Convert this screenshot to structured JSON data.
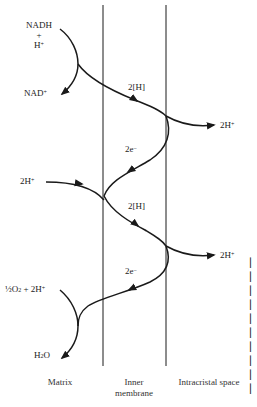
{
  "figure": {
    "reactants_top": {
      "line1": "NADH",
      "line2": "+",
      "line3": "H",
      "line3_sup": "+"
    },
    "product_top": {
      "text": "NAD",
      "sup": "+"
    },
    "transfer_1": "2[H]",
    "proton_out_1": {
      "text": "2H",
      "sup": "+"
    },
    "electron_1": {
      "text": "2e",
      "sup": "−"
    },
    "proton_in": {
      "text": "2H",
      "sup": "+"
    },
    "transfer_2": "2[H]",
    "proton_out_2": {
      "text": "2H",
      "sup": "+"
    },
    "electron_2": {
      "text": "2e",
      "sup": "−"
    },
    "reactants_bottom": {
      "frac": "½",
      "o2": "O",
      "o2_sub": "2",
      "rest": " + 2H",
      "sup": "+"
    },
    "product_bottom": {
      "h": "H",
      "sub": "2",
      "o": "O"
    },
    "regions": {
      "matrix": "Matrix",
      "inner_line1": "Inner",
      "inner_line2": "membrane",
      "intracristal": "Intracristal space"
    },
    "colors": {
      "line": "#1a1a1a",
      "text": "#222222",
      "background": "#ffffff"
    }
  }
}
